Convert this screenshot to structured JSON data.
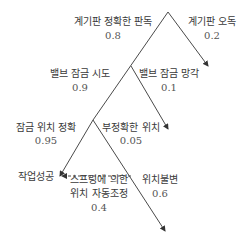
{
  "header": {
    "clipped_text": "ㅎ ㅎ...ㅎ"
  },
  "tree": {
    "level1": {
      "left": {
        "label": "계기판 정확한 판독",
        "prob": "0.8"
      },
      "right": {
        "label": "계기판 오독",
        "prob": "0.2"
      }
    },
    "level2": {
      "left": {
        "label": "밸브 잠금 시도",
        "prob": "0.9"
      },
      "right": {
        "label": "밸브 잠금 망각",
        "prob": "0.1"
      }
    },
    "level3": {
      "left": {
        "label": "잠금 위치 정확",
        "prob": "0.95"
      },
      "right": {
        "label": "부정확한 위치",
        "prob": "0.05"
      }
    },
    "level4": {
      "left": {
        "label_line1": "스프링에 의한",
        "label_line2": "위치 자동조정",
        "prob": "0.4"
      },
      "right": {
        "label": "위치불변",
        "prob": "0.6"
      }
    },
    "outcome": {
      "label": "작업성공"
    }
  },
  "colors": {
    "line": "#4a4a4a",
    "text": "#3a3a3a"
  }
}
